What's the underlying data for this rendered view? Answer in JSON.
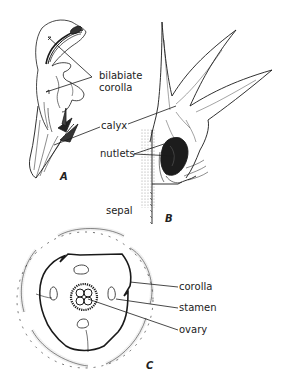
{
  "figure": {
    "panels": [
      {
        "id": "A",
        "label": "A",
        "description": "side view of flower with bilabiate corolla and calyx"
      },
      {
        "id": "B",
        "label": "B",
        "description": "calyx opened showing nutlets, with sepal"
      },
      {
        "id": "C",
        "label": "C",
        "description": "floral diagram cross-section"
      }
    ],
    "labels": {
      "bilabiate_line1": "bilabiate",
      "bilabiate_line2": "corolla",
      "calyx": "calyx",
      "nutlets": "nutlets",
      "sepal": "sepal",
      "corolla": "corolla",
      "stamen": "stamen",
      "ovary": "ovary"
    },
    "colors": {
      "ink": "#1a1a1a",
      "stipple": "#9a9a9a",
      "background": "#ffffff"
    }
  }
}
